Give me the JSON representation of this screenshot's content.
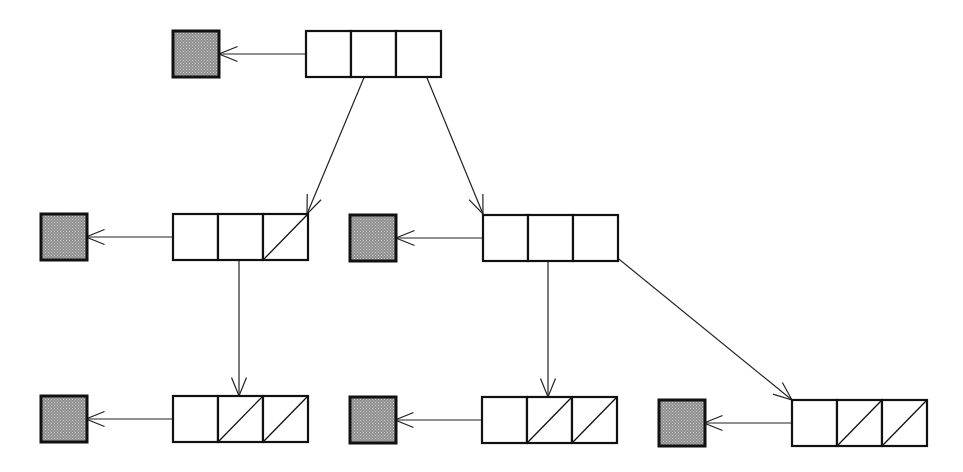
{
  "diagram": {
    "width": 963,
    "height": 472,
    "colors": {
      "background": "#ffffff",
      "stroke": "#111111",
      "data_fill": "#8f8f8f",
      "data_dot": "#c8c8c8"
    },
    "cell_width": 45,
    "cell_height": 46,
    "nodes": [
      {
        "id": "root",
        "x": 306,
        "y": 31,
        "null_cells": []
      },
      {
        "id": "left",
        "x": 173,
        "y": 214,
        "null_cells": [
          2
        ]
      },
      {
        "id": "right",
        "x": 483,
        "y": 215,
        "null_cells": []
      },
      {
        "id": "left-left",
        "x": 173,
        "y": 396,
        "null_cells": [
          1,
          2
        ]
      },
      {
        "id": "right-left",
        "x": 482,
        "y": 397,
        "null_cells": [
          1,
          2
        ]
      },
      {
        "id": "right-right",
        "x": 792,
        "y": 400,
        "null_cells": [
          1,
          2
        ]
      }
    ],
    "data_squares": [
      {
        "id": "root-data",
        "x": 173,
        "y": 31,
        "size": 46
      },
      {
        "id": "left-data",
        "x": 41,
        "y": 214,
        "size": 46
      },
      {
        "id": "right-data",
        "x": 350,
        "y": 215,
        "size": 46
      },
      {
        "id": "left-left-data",
        "x": 41,
        "y": 396,
        "size": 46
      },
      {
        "id": "right-left-data",
        "x": 350,
        "y": 397,
        "size": 46
      },
      {
        "id": "right-right-data",
        "x": 659,
        "y": 400,
        "size": 46
      }
    ],
    "edges": [
      {
        "id": "root-to-data",
        "from": [
          336,
          54
        ],
        "to": [
          219,
          54
        ]
      },
      {
        "id": "root-to-left",
        "from": [
          373,
          56
        ],
        "to": [
          307,
          214
        ]
      },
      {
        "id": "root-to-right",
        "from": [
          418,
          56
        ],
        "to": [
          483,
          214
        ]
      },
      {
        "id": "left-to-data",
        "from": [
          203,
          237
        ],
        "to": [
          86,
          237
        ]
      },
      {
        "id": "left-to-left-left",
        "from": [
          239,
          239
        ],
        "to": [
          239,
          396
        ]
      },
      {
        "id": "right-to-data",
        "from": [
          513,
          238
        ],
        "to": [
          396,
          238
        ]
      },
      {
        "id": "right-to-right-left",
        "from": [
          548,
          240
        ],
        "to": [
          548,
          397
        ]
      },
      {
        "id": "right-to-right-right",
        "from": [
          593,
          238
        ],
        "to": [
          792,
          400
        ]
      },
      {
        "id": "left-left-to-data",
        "from": [
          203,
          419
        ],
        "to": [
          86,
          419
        ]
      },
      {
        "id": "right-left-to-data",
        "from": [
          512,
          420
        ],
        "to": [
          395,
          420
        ]
      },
      {
        "id": "right-right-to-data",
        "from": [
          822,
          423
        ],
        "to": [
          704,
          423
        ]
      }
    ],
    "arrowhead_length": 20,
    "arrowhead_angle_deg": 22
  }
}
